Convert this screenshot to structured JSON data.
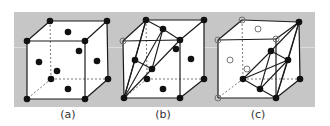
{
  "figure": {
    "background": "#ffffff",
    "panel": {
      "x": 14,
      "y": 12,
      "width": 301,
      "height": 95,
      "color": "#c6c6c6",
      "band_y": 47,
      "band_color": "#dcdcdc"
    },
    "stroke": "#1a1a1a",
    "face_fill": "#ffffff",
    "dot_color": "#111111"
  },
  "panels": [
    {
      "id": "a",
      "label": "(a)",
      "label_pos": [
        68,
        118
      ],
      "cube": {
        "ftl": [
          27,
          41
        ],
        "ftr": [
          85,
          41
        ],
        "fbl": [
          27,
          99
        ],
        "fbr": [
          85,
          99
        ],
        "btl": [
          50,
          21
        ],
        "btr": [
          107,
          21
        ],
        "bbl": [
          51,
          79
        ],
        "bbr": [
          108,
          79
        ]
      },
      "atoms": [
        {
          "p": [
            27,
            41
          ],
          "type": "filled"
        },
        {
          "p": [
            85,
            41
          ],
          "type": "filled"
        },
        {
          "p": [
            27,
            99
          ],
          "type": "filled"
        },
        {
          "p": [
            85,
            99
          ],
          "type": "filled"
        },
        {
          "p": [
            50,
            21
          ],
          "type": "filled"
        },
        {
          "p": [
            107,
            21
          ],
          "type": "filled"
        },
        {
          "p": [
            51,
            79
          ],
          "type": "filled"
        },
        {
          "p": [
            108,
            79
          ],
          "type": "filled"
        },
        {
          "p": [
            68,
            32
          ],
          "type": "filled"
        },
        {
          "p": [
            97,
            61
          ],
          "type": "filled"
        },
        {
          "p": [
            39,
            62
          ],
          "type": "filled"
        },
        {
          "p": [
            79,
            51
          ],
          "type": "filled"
        },
        {
          "p": [
            57,
            71
          ],
          "type": "filled"
        },
        {
          "p": [
            68,
            89
          ],
          "type": "filled"
        }
      ],
      "extra_lines": []
    },
    {
      "id": "b",
      "label": "(b)",
      "label_pos": [
        163,
        118
      ],
      "cube": {
        "ftl": [
          123,
          41
        ],
        "ftr": [
          180,
          40
        ],
        "fbl": [
          124,
          98
        ],
        "fbr": [
          180,
          98
        ],
        "btl": [
          146,
          20
        ],
        "btr": [
          204,
          20
        ],
        "bbl": [
          147,
          79
        ],
        "bbr": [
          204,
          79
        ]
      },
      "atoms": [
        {
          "p": [
            123,
            41
          ],
          "type": "open"
        },
        {
          "p": [
            180,
            40
          ],
          "type": "filled"
        },
        {
          "p": [
            124,
            98
          ],
          "type": "filled"
        },
        {
          "p": [
            180,
            98
          ],
          "type": "filled"
        },
        {
          "p": [
            146,
            20
          ],
          "type": "filled"
        },
        {
          "p": [
            204,
            20
          ],
          "type": "filled"
        },
        {
          "p": [
            147,
            79
          ],
          "type": "filled"
        },
        {
          "p": [
            204,
            79
          ],
          "type": "filled"
        },
        {
          "p": [
            163,
            29
          ],
          "type": "filled"
        },
        {
          "p": [
            135,
            60
          ],
          "type": "filled"
        },
        {
          "p": [
            152,
            69
          ],
          "type": "filled"
        },
        {
          "p": [
            176,
            49
          ],
          "type": "filled"
        },
        {
          "p": [
            191,
            59
          ],
          "type": "filled"
        },
        {
          "p": [
            163,
            89
          ],
          "type": "filled"
        }
      ],
      "extra_lines": [
        [
          [
            146,
            20
          ],
          [
            163,
            29
          ]
        ],
        [
          [
            163,
            29
          ],
          [
            180,
            40
          ]
        ],
        [
          [
            146,
            20
          ],
          [
            135,
            60
          ]
        ],
        [
          [
            163,
            29
          ],
          [
            152,
            69
          ]
        ],
        [
          [
            135,
            60
          ],
          [
            152,
            69
          ]
        ],
        [
          [
            124,
            98
          ],
          [
            135,
            60
          ]
        ],
        [
          [
            124,
            98
          ],
          [
            152,
            69
          ]
        ],
        [
          [
            124,
            98
          ],
          [
            146,
            20
          ]
        ],
        [
          [
            124,
            98
          ],
          [
            163,
            29
          ]
        ],
        [
          [
            152,
            69
          ],
          [
            180,
            40
          ]
        ]
      ]
    },
    {
      "id": "c",
      "label": "(c)",
      "label_pos": [
        258,
        118
      ],
      "cube": {
        "ftl": [
          218,
          40
        ],
        "ftr": [
          276,
          39
        ],
        "fbl": [
          218,
          98
        ],
        "fbr": [
          276,
          98
        ],
        "btl": [
          242,
          20
        ],
        "btr": [
          299,
          22
        ],
        "bbl": [
          243,
          79
        ],
        "bbr": [
          300,
          79
        ]
      },
      "atoms": [
        {
          "p": [
            218,
            40
          ],
          "type": "open"
        },
        {
          "p": [
            276,
            39
          ],
          "type": "open"
        },
        {
          "p": [
            218,
            98
          ],
          "type": "open"
        },
        {
          "p": [
            276,
            98
          ],
          "type": "filled"
        },
        {
          "p": [
            242,
            20
          ],
          "type": "open"
        },
        {
          "p": [
            299,
            22
          ],
          "type": "filled"
        },
        {
          "p": [
            243,
            79
          ],
          "type": "filled"
        },
        {
          "p": [
            300,
            79
          ],
          "type": "filled"
        },
        {
          "p": [
            258,
            29
          ],
          "type": "open"
        },
        {
          "p": [
            230,
            60
          ],
          "type": "open"
        },
        {
          "p": [
            247,
            69
          ],
          "type": "open"
        },
        {
          "p": [
            271,
            51
          ],
          "type": "filled"
        },
        {
          "p": [
            288,
            60
          ],
          "type": "filled"
        },
        {
          "p": [
            260,
            89
          ],
          "type": "filled"
        }
      ],
      "extra_lines": [
        [
          [
            299,
            22
          ],
          [
            271,
            51
          ]
        ],
        [
          [
            299,
            22
          ],
          [
            288,
            60
          ]
        ],
        [
          [
            299,
            22
          ],
          [
            276,
            98
          ]
        ],
        [
          [
            243,
            79
          ],
          [
            271,
            51
          ]
        ],
        [
          [
            243,
            79
          ],
          [
            260,
            89
          ]
        ],
        [
          [
            271,
            51
          ],
          [
            288,
            60
          ]
        ],
        [
          [
            271,
            51
          ],
          [
            260,
            89
          ]
        ],
        [
          [
            288,
            60
          ],
          [
            260,
            89
          ]
        ],
        [
          [
            260,
            89
          ],
          [
            276,
            98
          ]
        ],
        [
          [
            288,
            60
          ],
          [
            276,
            98
          ]
        ],
        [
          [
            243,
            79
          ],
          [
            288,
            60
          ]
        ]
      ]
    }
  ]
}
